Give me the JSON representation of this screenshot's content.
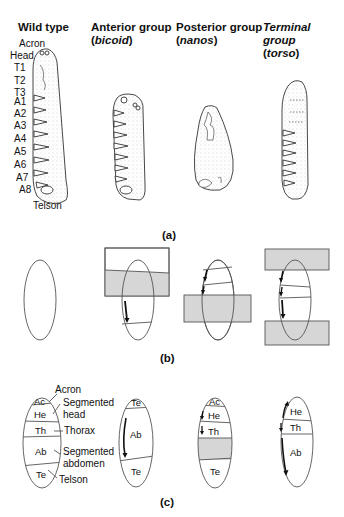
{
  "headers": {
    "wild": {
      "line1": "Wild type",
      "line2": ""
    },
    "anterior": {
      "line1": "Anterior group",
      "line2_open": "(",
      "line2_gene": "bicoid",
      "line2_close": ")"
    },
    "posterior": {
      "line1": "Posterior group",
      "line2_open": "(",
      "line2_gene": "nanos",
      "line2_close": ")"
    },
    "terminal": {
      "line1": "Terminal group",
      "line2_open": "(",
      "line2_gene": "torso",
      "line2_close": ")"
    }
  },
  "wild_type_segments": [
    "Acron",
    "Head",
    "T1",
    "T2",
    "T3",
    "A1",
    "A2",
    "A3",
    "A4",
    "A5",
    "A6",
    "A7",
    "A8",
    "Telson"
  ],
  "panel_labels": {
    "a": "(a)",
    "b": "(b)",
    "c": "(c)"
  },
  "panel_c": {
    "wild": {
      "regions": [
        "Ac",
        "He",
        "Th",
        "Ab",
        "Te"
      ],
      "callouts": {
        "acron": "Acron",
        "head_1": "Segmented",
        "head_2": "head",
        "thorax": "Thorax",
        "abd_1": "Segmented",
        "abd_2": "abdomen",
        "telson": "Telson"
      }
    },
    "anterior": {
      "regions": [
        "Te",
        "Ab",
        "Te"
      ]
    },
    "posterior": {
      "regions": [
        "Ac",
        "He",
        "Th",
        "Te"
      ]
    },
    "terminal": {
      "regions": [
        "He",
        "Th",
        "Ab"
      ]
    }
  },
  "colors": {
    "shade": "#d6d6d6",
    "line": "#555555",
    "ink": "#111111"
  }
}
